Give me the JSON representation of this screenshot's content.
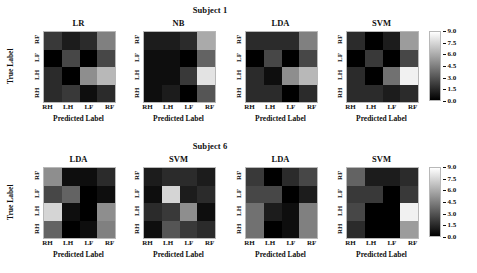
{
  "figure": {
    "width": 477,
    "height": 273,
    "background": "#ffffff"
  },
  "axis_labels": {
    "xlabel": "Predicted Label",
    "ylabel": "True Label",
    "xticks": [
      "RH",
      "LH",
      "LF",
      "RF"
    ],
    "yticks": [
      "RH",
      "LH",
      "LF",
      "RF"
    ]
  },
  "colorbar": {
    "ticks": [
      "0.0",
      "1.5",
      "3.0",
      "4.5",
      "6.0",
      "7.5",
      "9.0"
    ],
    "vmin": 0.0,
    "vmax": 9.0,
    "cmap": "gray",
    "low_color": "#000000",
    "high_color": "#ffffff"
  },
  "rows": [
    {
      "suptitle": "Subject 1",
      "panels": [
        {
          "title": "LR"
        },
        {
          "title": "NB"
        },
        {
          "title": "LDA"
        },
        {
          "title": "SVM"
        }
      ]
    },
    {
      "suptitle": "Subject 6",
      "panels": [
        {
          "title": "LDA"
        },
        {
          "title": "SVM"
        },
        {
          "title": "LDA"
        },
        {
          "title": "SVM"
        }
      ]
    }
  ],
  "chart_data": {
    "type": "heatmap",
    "xlabel": "Predicted Label",
    "ylabel": "True Label",
    "categories_x": [
      "RH",
      "LH",
      "LF",
      "RF"
    ],
    "categories_y_bottom_to_top": [
      "RH",
      "LH",
      "LF",
      "RF"
    ],
    "vmin": 0.0,
    "vmax": 9.0,
    "colorbar_ticks": [
      0.0,
      1.5,
      3.0,
      4.5,
      6.0,
      7.5,
      9.0
    ],
    "colormap": "gray",
    "grid": false,
    "legend": "colorbar-right",
    "panels": [
      {
        "subject": "Subject 1",
        "classifier": "LR",
        "row": 0,
        "col": 0,
        "matrix_rows_top_to_bottom": [
          "RF",
          "LF",
          "LH",
          "RH"
        ],
        "values": [
          [
            2.0,
            1.0,
            1.5,
            4.5
          ],
          [
            0.0,
            2.5,
            0.0,
            2.5
          ],
          [
            1.5,
            0.0,
            5.0,
            6.5
          ],
          [
            1.5,
            2.0,
            0.5,
            1.5
          ]
        ]
      },
      {
        "subject": "Subject 1",
        "classifier": "NB",
        "row": 0,
        "col": 1,
        "matrix_rows_top_to_bottom": [
          "RF",
          "LF",
          "LH",
          "RH"
        ],
        "values": [
          [
            1.0,
            1.0,
            1.5,
            6.0
          ],
          [
            0.5,
            0.5,
            0.0,
            3.5
          ],
          [
            0.5,
            0.5,
            2.0,
            8.0
          ],
          [
            0.5,
            1.0,
            0.0,
            3.0
          ]
        ]
      },
      {
        "subject": "Subject 1",
        "classifier": "LDA",
        "row": 0,
        "col": 2,
        "matrix_rows_top_to_bottom": [
          "RF",
          "LF",
          "LH",
          "RH"
        ],
        "values": [
          [
            1.5,
            1.5,
            1.5,
            4.5
          ],
          [
            0.0,
            2.5,
            0.0,
            2.5
          ],
          [
            1.5,
            0.5,
            5.0,
            6.5
          ],
          [
            1.5,
            1.5,
            0.0,
            1.5
          ]
        ]
      },
      {
        "subject": "Subject 1",
        "classifier": "SVM",
        "row": 0,
        "col": 3,
        "matrix_rows_top_to_bottom": [
          "RF",
          "LF",
          "LH",
          "RH"
        ],
        "values": [
          [
            1.5,
            0.0,
            1.0,
            5.5
          ],
          [
            0.0,
            2.0,
            0.0,
            2.5
          ],
          [
            1.5,
            0.0,
            4.0,
            8.5
          ],
          [
            1.5,
            1.5,
            1.0,
            1.5
          ]
        ]
      },
      {
        "subject": "Subject 6",
        "classifier": "LDA",
        "row": 1,
        "col": 0,
        "matrix_rows_top_to_bottom": [
          "RF",
          "LF",
          "LH",
          "RH"
        ],
        "values": [
          [
            5.0,
            0.5,
            0.5,
            1.5
          ],
          [
            2.5,
            3.5,
            0.0,
            0.5
          ],
          [
            7.5,
            0.5,
            0.0,
            5.0
          ],
          [
            3.5,
            0.0,
            0.5,
            4.5
          ]
        ]
      },
      {
        "subject": "Subject 6",
        "classifier": "SVM",
        "row": 1,
        "col": 1,
        "matrix_rows_top_to_bottom": [
          "RF",
          "LF",
          "LH",
          "RH"
        ],
        "values": [
          [
            1.0,
            1.5,
            1.5,
            1.0
          ],
          [
            0.5,
            7.5,
            1.0,
            1.5
          ],
          [
            1.5,
            2.0,
            5.0,
            0.5
          ],
          [
            0.5,
            3.0,
            2.0,
            1.5
          ]
        ]
      },
      {
        "subject": "Subject 6",
        "classifier": "LDA",
        "row": 1,
        "col": 2,
        "matrix_rows_top_to_bottom": [
          "RF",
          "LF",
          "LH",
          "RH"
        ],
        "values": [
          [
            2.0,
            0.0,
            1.5,
            2.5
          ],
          [
            2.5,
            2.5,
            0.0,
            1.0
          ],
          [
            4.0,
            1.0,
            0.5,
            4.5
          ],
          [
            4.0,
            0.0,
            0.5,
            4.5
          ]
        ]
      },
      {
        "subject": "Subject 6",
        "classifier": "SVM",
        "row": 1,
        "col": 3,
        "matrix_rows_top_to_bottom": [
          "RF",
          "LF",
          "LH",
          "RH"
        ],
        "values": [
          [
            3.5,
            1.0,
            1.0,
            1.5
          ],
          [
            2.0,
            2.0,
            0.0,
            2.0
          ],
          [
            2.5,
            0.0,
            0.0,
            8.5
          ],
          [
            1.5,
            0.0,
            0.0,
            5.5
          ]
        ]
      }
    ]
  }
}
